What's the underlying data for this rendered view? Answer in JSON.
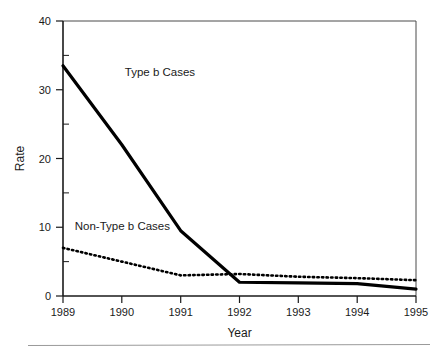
{
  "chart_data": {
    "type": "line",
    "title": "",
    "xlabel": "Year",
    "ylabel": "Rate",
    "categories": [
      "1989",
      "1990",
      "1991",
      "1992",
      "1993",
      "1994",
      "1995"
    ],
    "x": [
      1989,
      1990,
      1991,
      1992,
      1993,
      1994,
      1995
    ],
    "xlim": [
      1989,
      1995
    ],
    "ylim": [
      0,
      40
    ],
    "y_ticks": [
      "0",
      "10",
      "20",
      "30",
      "40"
    ],
    "y_tick_values": [
      0,
      10,
      20,
      30,
      40
    ],
    "y_minor_tick_values": [
      5,
      15,
      25,
      35
    ],
    "grid": false,
    "legend_position": "inline-annotation",
    "series": [
      {
        "name": "Type b Cases",
        "style": "solid",
        "color": "#000000",
        "line_width": 3.2,
        "values": [
          33.5,
          22.0,
          9.5,
          2.0,
          1.9,
          1.8,
          1.0
        ],
        "label_x": 1990.05,
        "label_y": 32.0
      },
      {
        "name": "Non-Type b Cases",
        "style": "dotted",
        "color": "#000000",
        "line_width": 2.6,
        "values": [
          7.0,
          5.0,
          3.0,
          3.2,
          2.8,
          2.6,
          2.3
        ],
        "label_x": 1989.2,
        "label_y": 9.6
      }
    ],
    "annotations": [
      {
        "text": "Type b Cases",
        "series": "Type b Cases"
      },
      {
        "text": "Non-Type b Cases",
        "series": "Non-Type b Cases"
      }
    ]
  },
  "axes": {
    "y_axis_title": "Rate",
    "x_axis_title": "Year",
    "y_tick_labels": [
      "40",
      "30",
      "20",
      "10",
      "0"
    ],
    "x_tick_labels": [
      "1989",
      "1990",
      "1991",
      "1992",
      "1993",
      "1994",
      "1995"
    ]
  },
  "labels": {
    "type_b": "Type b Cases",
    "non_type_b": "Non-Type b Cases"
  }
}
